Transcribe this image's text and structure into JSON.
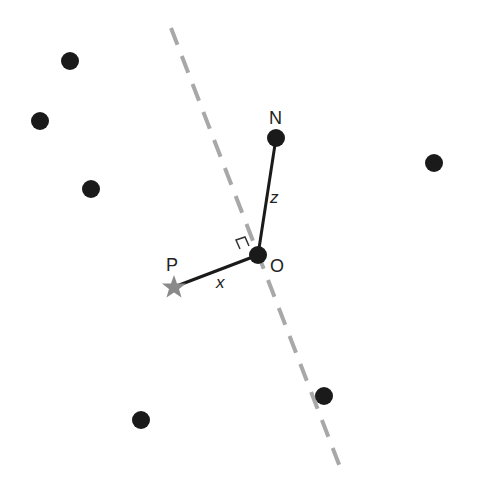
{
  "diagram": {
    "dashed_line": {
      "x1": 171,
      "y1": 28,
      "x2": 340,
      "y2": 467,
      "color": "#a8a8a8"
    },
    "dots": [
      {
        "x": 70,
        "y": 61
      },
      {
        "x": 40,
        "y": 121
      },
      {
        "x": 91,
        "y": 189
      },
      {
        "x": 434,
        "y": 163
      },
      {
        "x": 141,
        "y": 420
      },
      {
        "x": 324,
        "y": 396
      }
    ],
    "dot_color": "#1a1a1a",
    "points": {
      "O": {
        "label": "O",
        "x": 258,
        "y": 255
      },
      "N": {
        "label": "N",
        "x": 276,
        "y": 138
      },
      "P": {
        "label": "P",
        "x": 174,
        "y": 287
      }
    },
    "segments": {
      "x_label": "x",
      "z_label": "z"
    },
    "star_color": "#8a8a8a"
  }
}
